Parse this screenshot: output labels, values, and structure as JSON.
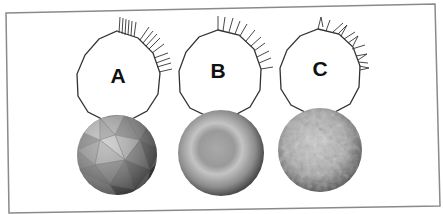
{
  "figure": {
    "colors": {
      "background": "#ffffff",
      "frame": "#8a8a8a",
      "outline": "#333333",
      "arrow": "#333333"
    },
    "panels": [
      {
        "id": "A",
        "label": "A",
        "normals": "flat (per-face)",
        "sphere": "faceted"
      },
      {
        "id": "B",
        "label": "B",
        "normals": "smooth (interpolated)",
        "sphere": "smooth"
      },
      {
        "id": "C",
        "label": "C",
        "normals": "perturbed (bump)",
        "sphere": "bumpy"
      }
    ]
  }
}
